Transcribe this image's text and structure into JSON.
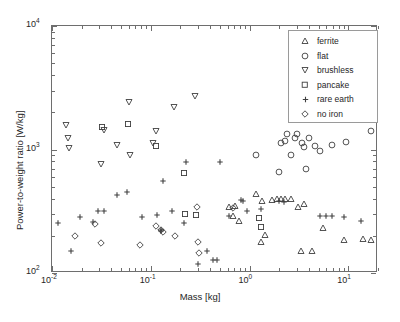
{
  "chart_data": {
    "type": "scatter",
    "title": "",
    "xlabel": "Mass [kg]",
    "ylabel": "Power-to-weight ratio [W/kg]",
    "xscale": "log",
    "yscale": "log",
    "xlim": [
      0.01,
      20
    ],
    "ylim": [
      100,
      10000
    ],
    "xticks": [
      0.01,
      0.1,
      1,
      10
    ],
    "xticklabels": [
      "10-2",
      "10-1",
      "100",
      "101"
    ],
    "yticks": [
      100,
      1000,
      10000
    ],
    "yticklabels": [
      "102",
      "103",
      "104"
    ],
    "grid": false,
    "legend_position": "upper right",
    "series": [
      {
        "name": "ferrite",
        "marker": "triangle-up",
        "points": [
          [
            0.62,
            340
          ],
          [
            0.68,
            288
          ],
          [
            0.72,
            350
          ],
          [
            0.78,
            262
          ],
          [
            1.15,
            440
          ],
          [
            1.35,
            380
          ],
          [
            1.45,
            205
          ],
          [
            1.3,
            178
          ],
          [
            1.7,
            390
          ],
          [
            1.9,
            395
          ],
          [
            2.1,
            400
          ],
          [
            2.3,
            395
          ],
          [
            2.6,
            398
          ],
          [
            3.1,
            345
          ],
          [
            3.6,
            365
          ],
          [
            3.3,
            150
          ],
          [
            4.3,
            152
          ],
          [
            5.6,
            232
          ],
          [
            9.0,
            185
          ],
          [
            14.0,
            188
          ],
          [
            17.0,
            185
          ]
        ]
      },
      {
        "name": "flat",
        "marker": "circle",
        "points": [
          [
            1.15,
            900
          ],
          [
            2.0,
            660
          ],
          [
            2.1,
            1130
          ],
          [
            2.3,
            1180
          ],
          [
            2.4,
            1330
          ],
          [
            2.6,
            905
          ],
          [
            2.9,
            1230
          ],
          [
            3.0,
            1340
          ],
          [
            3.4,
            1120
          ],
          [
            3.6,
            1040
          ],
          [
            3.7,
            690
          ],
          [
            4.0,
            1230
          ],
          [
            4.6,
            1075
          ],
          [
            5.2,
            965
          ],
          [
            6.8,
            1090
          ],
          [
            9.5,
            1140
          ],
          [
            17.0,
            1420
          ]
        ]
      },
      {
        "name": "brushless",
        "marker": "triangle-down",
        "points": [
          [
            0.014,
            1590
          ],
          [
            0.0145,
            1250
          ],
          [
            0.015,
            1020
          ],
          [
            0.031,
            760
          ],
          [
            0.034,
            1440
          ],
          [
            0.046,
            1090
          ],
          [
            0.06,
            2420
          ],
          [
            0.062,
            900
          ],
          [
            0.105,
            1120
          ],
          [
            0.112,
            1400
          ],
          [
            0.17,
            2220
          ],
          [
            0.28,
            2700
          ]
        ]
      },
      {
        "name": "pancake",
        "marker": "square",
        "points": [
          [
            0.032,
            1520
          ],
          [
            0.059,
            1600
          ],
          [
            0.112,
            1070
          ],
          [
            0.215,
            640
          ],
          [
            0.22,
            300
          ],
          [
            0.29,
            295
          ],
          [
            1.25,
            280
          ],
          [
            1.3,
            235
          ]
        ]
      },
      {
        "name": "rare earth",
        "marker": "plus",
        "points": [
          [
            0.0115,
            255
          ],
          [
            0.0155,
            152
          ],
          [
            0.019,
            285
          ],
          [
            0.026,
            258
          ],
          [
            0.029,
            320
          ],
          [
            0.034,
            320
          ],
          [
            0.046,
            430
          ],
          [
            0.058,
            455
          ],
          [
            0.081,
            285
          ],
          [
            0.115,
            295
          ],
          [
            0.126,
            222
          ],
          [
            0.128,
            218
          ],
          [
            0.132,
            560
          ],
          [
            0.165,
            318
          ],
          [
            0.215,
            252
          ],
          [
            0.225,
            790
          ],
          [
            0.3,
            118
          ],
          [
            0.37,
            150
          ],
          [
            0.43,
            128
          ],
          [
            0.47,
            128
          ],
          [
            0.5,
            790
          ],
          [
            0.62,
            290
          ],
          [
            0.82,
            390
          ],
          [
            0.85,
            385
          ],
          [
            0.95,
            320
          ],
          [
            1.3,
            330
          ],
          [
            2.0,
            380
          ],
          [
            2.25,
            378
          ],
          [
            5.2,
            290
          ],
          [
            6.0,
            292
          ],
          [
            6.8,
            290
          ],
          [
            9.0,
            285
          ],
          [
            13.5,
            262
          ]
        ]
      },
      {
        "name": "no iron",
        "marker": "diamond",
        "points": [
          [
            0.017,
            198
          ],
          [
            0.027,
            248
          ],
          [
            0.031,
            175
          ],
          [
            0.078,
            168
          ],
          [
            0.112,
            240
          ],
          [
            0.128,
            222
          ],
          [
            0.132,
            215
          ],
          [
            0.175,
            198
          ],
          [
            0.295,
            340
          ],
          [
            0.3,
            178
          ],
          [
            0.31,
            145
          ],
          [
            0.68,
            335
          ]
        ]
      }
    ]
  },
  "legend": {
    "entries": [
      {
        "label": "ferrite"
      },
      {
        "label": "flat"
      },
      {
        "label": "brushless"
      },
      {
        "label": "pancake"
      },
      {
        "label": "rare earth"
      },
      {
        "label": "no iron"
      }
    ]
  },
  "axes": {
    "x_tick_labels": [
      {
        "base": "10",
        "exp": "-2"
      },
      {
        "base": "10",
        "exp": "-1"
      },
      {
        "base": "10",
        "exp": "0"
      },
      {
        "base": "10",
        "exp": "1"
      }
    ],
    "y_tick_labels": [
      {
        "base": "10",
        "exp": "4"
      },
      {
        "base": "10",
        "exp": "3"
      },
      {
        "base": "10",
        "exp": "2"
      }
    ]
  },
  "colors": {
    "marker": "#3f3f3f",
    "axis": "#6e6e6e",
    "text": "#262626",
    "background": "#ffffff"
  }
}
